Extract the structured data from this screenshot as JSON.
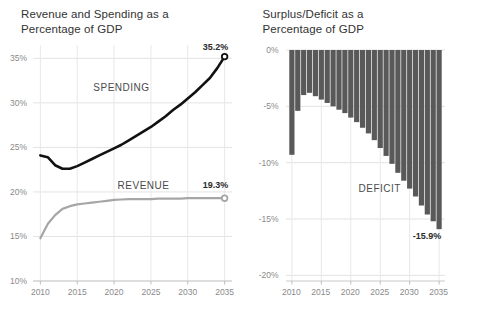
{
  "figure": {
    "width": 483,
    "height": 314,
    "background": "#ffffff"
  },
  "panels": [
    {
      "name": "revenue-spending",
      "title": "Revenue and Spending as a\nPercentage of GDP"
    },
    {
      "name": "surplus-deficit",
      "title": "Surplus/Deficit as a\nPercentage of GDP"
    }
  ],
  "chart_data": [
    {
      "type": "line",
      "name": "revenue-and-spending",
      "title": "Revenue and Spending as a Percentage of GDP",
      "xlabel": "",
      "ylabel": "",
      "xlim": [
        2009,
        2036
      ],
      "ylim": [
        10,
        36.5
      ],
      "grid": true,
      "yticks": [
        10,
        15,
        20,
        25,
        30,
        35
      ],
      "ytick_labels": [
        "10%",
        "15%",
        "20%",
        "25%",
        "30%",
        "35%"
      ],
      "xticks": [
        2010,
        2015,
        2020,
        2025,
        2030,
        2035
      ],
      "xtick_labels": [
        "2010",
        "2015",
        "2020",
        "2025",
        "2030",
        "2035"
      ],
      "legend": "inline-annotations",
      "annotations": [
        {
          "text": "SPENDING",
          "x": 2021,
          "y": 31.6
        },
        {
          "text": "REVENUE",
          "x": 2024,
          "y": 20.6
        },
        {
          "text": "35.2%",
          "x": 2035,
          "y": 36.0
        },
        {
          "text": "19.3%",
          "x": 2035,
          "y": 20.6
        }
      ],
      "x": [
        2010,
        2011,
        2012,
        2013,
        2014,
        2015,
        2016,
        2017,
        2018,
        2019,
        2020,
        2021,
        2022,
        2023,
        2024,
        2025,
        2026,
        2027,
        2028,
        2029,
        2030,
        2031,
        2032,
        2033,
        2034,
        2035
      ],
      "series": [
        {
          "name": "SPENDING",
          "color": "#111111",
          "end_label": "35.2%",
          "end_marker": "open-circle",
          "values": [
            24.1,
            23.9,
            23.0,
            22.6,
            22.6,
            22.9,
            23.3,
            23.7,
            24.1,
            24.5,
            24.9,
            25.3,
            25.8,
            26.3,
            26.8,
            27.3,
            27.9,
            28.5,
            29.2,
            29.8,
            30.5,
            31.2,
            32.0,
            32.8,
            33.9,
            35.2
          ]
        },
        {
          "name": "REVENUE",
          "color": "#a6a6a6",
          "end_label": "19.3%",
          "end_marker": "open-circle",
          "values": [
            14.8,
            16.4,
            17.4,
            18.1,
            18.4,
            18.6,
            18.7,
            18.8,
            18.9,
            19.0,
            19.1,
            19.15,
            19.2,
            19.2,
            19.2,
            19.2,
            19.25,
            19.25,
            19.25,
            19.25,
            19.3,
            19.3,
            19.3,
            19.3,
            19.3,
            19.3
          ]
        }
      ]
    },
    {
      "type": "bar",
      "name": "surplus-deficit",
      "title": "Surplus/Deficit as a Percentage of GDP",
      "xlabel": "",
      "ylabel": "",
      "xlim": [
        2009,
        2036
      ],
      "ylim": [
        -20.5,
        0
      ],
      "grid": true,
      "bar_color": "#595959",
      "yticks": [
        0,
        -5,
        -10,
        -15,
        -20
      ],
      "ytick_labels": [
        "0%",
        "-5%",
        "-10%",
        "-15%",
        "-20%"
      ],
      "xticks": [
        2010,
        2015,
        2020,
        2025,
        2030,
        2035
      ],
      "xtick_labels": [
        "2010",
        "2015",
        "2020",
        "2025",
        "2030",
        "2035"
      ],
      "annotations": [
        {
          "text": "DEFICIT",
          "x": 2025,
          "y": -12.4
        },
        {
          "text": "-15.9%",
          "x": 2034,
          "y": -16.6
        }
      ],
      "categories": [
        2010,
        2011,
        2012,
        2013,
        2014,
        2015,
        2016,
        2017,
        2018,
        2019,
        2020,
        2021,
        2022,
        2023,
        2024,
        2025,
        2026,
        2027,
        2028,
        2029,
        2030,
        2031,
        2032,
        2033,
        2034,
        2035
      ],
      "values": [
        -9.3,
        -5.4,
        -4.0,
        -3.8,
        -4.1,
        -4.4,
        -4.7,
        -5.0,
        -5.3,
        -5.6,
        -6.0,
        -6.4,
        -6.9,
        -7.4,
        -8.0,
        -8.7,
        -9.4,
        -10.1,
        -10.9,
        -11.6,
        -12.3,
        -13.0,
        -13.8,
        -14.6,
        -15.2,
        -15.9
      ],
      "end_label": "-15.9%"
    }
  ]
}
